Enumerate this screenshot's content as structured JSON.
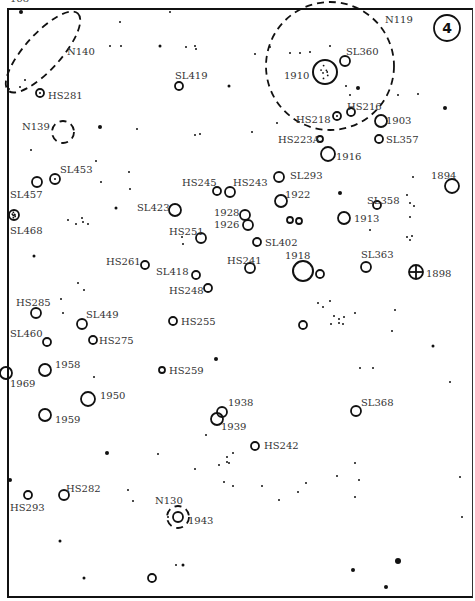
{
  "page": {
    "number": "168",
    "chart_number": "4"
  },
  "nebulae": [
    {
      "id": "N140",
      "type": "ellipse",
      "cx": 43,
      "cy": 52,
      "rx": 52,
      "ry": 18,
      "rot": -48,
      "label_x": 67,
      "label_y": 55
    },
    {
      "id": "N139",
      "type": "circle",
      "cx": 63,
      "cy": 132,
      "r": 11,
      "label_x": 22,
      "label_y": 130
    },
    {
      "id": "N119",
      "type": "circle",
      "cx": 330,
      "cy": 66,
      "r": 64,
      "label_x": 385,
      "label_y": 23
    },
    {
      "id": "N130",
      "type": "circle",
      "cx": 178,
      "cy": 517,
      "r": 11,
      "label_x": 155,
      "label_y": 504
    }
  ],
  "clusters": [
    {
      "id": "HS281",
      "x": 40,
      "y": 93,
      "r": 4,
      "label_x": 48,
      "label_y": 99,
      "double": true
    },
    {
      "id": "SL419",
      "x": 179,
      "y": 86,
      "r": 4,
      "label_x": 175,
      "label_y": 79
    },
    {
      "id": "SL360",
      "x": 345,
      "y": 61,
      "r": 5,
      "label_x": 346,
      "label_y": 55
    },
    {
      "id": "1910",
      "x": 325,
      "y": 72,
      "r": 12,
      "label_x": 284,
      "label_y": 79,
      "dotted": true
    },
    {
      "id": "HS218",
      "x": 337,
      "y": 116,
      "r": 4,
      "label_x": 296,
      "label_y": 123,
      "double": true
    },
    {
      "id": "HS216",
      "x": 351,
      "y": 112,
      "r": 4,
      "label_x": 347,
      "label_y": 110
    },
    {
      "id": "1903",
      "x": 381,
      "y": 121,
      "r": 6,
      "label_x": 386,
      "label_y": 124
    },
    {
      "id": "HS223A",
      "x": 320,
      "y": 139,
      "r": 3,
      "label_x": 278,
      "label_y": 143
    },
    {
      "id": "SL357",
      "x": 379,
      "y": 139,
      "r": 4,
      "label_x": 386,
      "label_y": 143
    },
    {
      "id": "1916",
      "x": 328,
      "y": 154,
      "r": 7,
      "label_x": 336,
      "label_y": 160
    },
    {
      "id": "SL453",
      "x": 55,
      "y": 179,
      "r": 5,
      "label_x": 60,
      "label_y": 173,
      "double": true
    },
    {
      "id": "SL457",
      "x": 37,
      "y": 182,
      "r": 5,
      "label_x": 10,
      "label_y": 198
    },
    {
      "id": "HS245",
      "x": 217,
      "y": 191,
      "r": 4,
      "label_x": 182,
      "label_y": 186
    },
    {
      "id": "HS243",
      "x": 230,
      "y": 192,
      "r": 5,
      "label_x": 233,
      "label_y": 186
    },
    {
      "id": "SL293",
      "x": 279,
      "y": 177,
      "r": 5,
      "label_x": 290,
      "label_y": 179
    },
    {
      "id": "1922",
      "x": 281,
      "y": 201,
      "r": 6,
      "label_x": 285,
      "label_y": 198
    },
    {
      "id": "1894",
      "x": 452,
      "y": 186,
      "r": 7,
      "label_x": 431,
      "label_y": 179
    },
    {
      "id": "SL358",
      "x": 377,
      "y": 205,
      "r": 4,
      "label_x": 367,
      "label_y": 204
    },
    {
      "id": "SL468",
      "x": 14,
      "y": 215,
      "r": 5,
      "label_x": 10,
      "label_y": 234,
      "dotted": true
    },
    {
      "id": "SL423",
      "x": 175,
      "y": 210,
      "r": 6,
      "label_x": 137,
      "label_y": 211
    },
    {
      "id": "1928",
      "x": 245,
      "y": 215,
      "r": 5,
      "label_x": 214,
      "label_y": 216
    },
    {
      "id": "1926",
      "x": 248,
      "y": 225,
      "r": 5,
      "label_x": 214,
      "label_y": 228
    },
    {
      "id": "1913",
      "x": 344,
      "y": 218,
      "r": 6,
      "label_x": 354,
      "label_y": 222
    },
    {
      "id": "HS251",
      "x": 201,
      "y": 238,
      "r": 5,
      "label_x": 169,
      "label_y": 235
    },
    {
      "id": "SL402",
      "x": 257,
      "y": 242,
      "r": 4,
      "label_x": 265,
      "label_y": 246
    },
    {
      "id": "HS261",
      "x": 145,
      "y": 265,
      "r": 4,
      "label_x": 106,
      "label_y": 265
    },
    {
      "id": "HS241",
      "x": 250,
      "y": 268,
      "r": 5,
      "label_x": 227,
      "label_y": 264
    },
    {
      "id": "1918",
      "x": 303,
      "y": 271,
      "r": 10,
      "label_x": 285,
      "label_y": 259
    },
    {
      "id": "SL363",
      "x": 366,
      "y": 267,
      "r": 5,
      "label_x": 361,
      "label_y": 258
    },
    {
      "id": "1898",
      "x": 416,
      "y": 272,
      "r": 7,
      "label_x": 426,
      "label_y": 277,
      "cross": true
    },
    {
      "id": "SL418",
      "x": 196,
      "y": 275,
      "r": 4,
      "label_x": 156,
      "label_y": 275
    },
    {
      "id": "HS248",
      "x": 208,
      "y": 288,
      "r": 4,
      "label_x": 169,
      "label_y": 294
    },
    {
      "id": "HS285",
      "x": 36,
      "y": 313,
      "r": 5,
      "label_x": 16,
      "label_y": 306
    },
    {
      "id": "SL449",
      "x": 82,
      "y": 324,
      "r": 5,
      "label_x": 86,
      "label_y": 318
    },
    {
      "id": "HS255",
      "x": 173,
      "y": 321,
      "r": 4,
      "label_x": 181,
      "label_y": 325
    },
    {
      "id": "SL460",
      "x": 47,
      "y": 342,
      "r": 4,
      "label_x": 10,
      "label_y": 337
    },
    {
      "id": "HS275",
      "x": 93,
      "y": 340,
      "r": 4,
      "label_x": 99,
      "label_y": 344
    },
    {
      "id": "1958",
      "x": 45,
      "y": 370,
      "r": 6,
      "label_x": 55,
      "label_y": 368
    },
    {
      "id": "HS259",
      "x": 162,
      "y": 370,
      "r": 3,
      "label_x": 169,
      "label_y": 374
    },
    {
      "id": "1969",
      "x": 6,
      "y": 373,
      "r": 6,
      "label_x": 10,
      "label_y": 387
    },
    {
      "id": "1950",
      "x": 88,
      "y": 399,
      "r": 7,
      "label_x": 100,
      "label_y": 399
    },
    {
      "id": "1938",
      "x": 222,
      "y": 412,
      "r": 5,
      "label_x": 228,
      "label_y": 406
    },
    {
      "id": "1939",
      "x": 217,
      "y": 419,
      "r": 6,
      "label_x": 221,
      "label_y": 430
    },
    {
      "id": "SL368",
      "x": 356,
      "y": 411,
      "r": 5,
      "label_x": 361,
      "label_y": 406
    },
    {
      "id": "1959",
      "x": 45,
      "y": 415,
      "r": 6,
      "label_x": 55,
      "label_y": 423
    },
    {
      "id": "HS242",
      "x": 255,
      "y": 446,
      "r": 4,
      "label_x": 264,
      "label_y": 449
    },
    {
      "id": "HS282",
      "x": 64,
      "y": 495,
      "r": 5,
      "label_x": 66,
      "label_y": 492
    },
    {
      "id": "HS293",
      "x": 28,
      "y": 495,
      "r": 4,
      "label_x": 10,
      "label_y": 511
    },
    {
      "id": "1943",
      "x": 178,
      "y": 517,
      "r": 5,
      "label_x": 188,
      "label_y": 524
    },
    {
      "id": "",
      "x": 152,
      "y": 578,
      "r": 4
    },
    {
      "id": "",
      "x": 303,
      "y": 325,
      "r": 4
    },
    {
      "id": "",
      "x": 320,
      "y": 274,
      "r": 4
    },
    {
      "id": "",
      "x": 290,
      "y": 220,
      "r": 3
    },
    {
      "id": "",
      "x": 299,
      "y": 221,
      "r": 3
    }
  ],
  "stars": [
    [
      21,
      12,
      2
    ],
    [
      170,
      12,
      1
    ],
    [
      120,
      22,
      1
    ],
    [
      160,
      46,
      1.5
    ],
    [
      121,
      46,
      1
    ],
    [
      110,
      46,
      1
    ],
    [
      186,
      47,
      1
    ],
    [
      195,
      46,
      1
    ],
    [
      229,
      86,
      1.5
    ],
    [
      196,
      49,
      1
    ],
    [
      9,
      89,
      1
    ],
    [
      20,
      87,
      1
    ],
    [
      25,
      80,
      1
    ],
    [
      255,
      54,
      1
    ],
    [
      270,
      47,
      1
    ],
    [
      290,
      53,
      1
    ],
    [
      310,
      52,
      1
    ],
    [
      300,
      53,
      1
    ],
    [
      330,
      46,
      1
    ],
    [
      346,
      86,
      1
    ],
    [
      358,
      88,
      2
    ],
    [
      350,
      95,
      1
    ],
    [
      398,
      95,
      1
    ],
    [
      445,
      108,
      2
    ],
    [
      418,
      94,
      1
    ],
    [
      100,
      127,
      2
    ],
    [
      137,
      129,
      1
    ],
    [
      195,
      135,
      1
    ],
    [
      200,
      134,
      1
    ],
    [
      277,
      123,
      1
    ],
    [
      252,
      132,
      1
    ],
    [
      31,
      150,
      1
    ],
    [
      96,
      161,
      1
    ],
    [
      129,
      172,
      1
    ],
    [
      101,
      182,
      1
    ],
    [
      130,
      189,
      1
    ],
    [
      116,
      208,
      1.5
    ],
    [
      68,
      220,
      1
    ],
    [
      76,
      224,
      1
    ],
    [
      83,
      222,
      1
    ],
    [
      88,
      224,
      1
    ],
    [
      82,
      218,
      1
    ],
    [
      182,
      237,
      1
    ],
    [
      183,
      244,
      1
    ],
    [
      34,
      256,
      1.5
    ],
    [
      413,
      177,
      1
    ],
    [
      407,
      195,
      1
    ],
    [
      410,
      203,
      1
    ],
    [
      414,
      206,
      1
    ],
    [
      410,
      217,
      1
    ],
    [
      370,
      230,
      1
    ],
    [
      407,
      237,
      1
    ],
    [
      410,
      240,
      1
    ],
    [
      412,
      236,
      1
    ],
    [
      340,
      193,
      2
    ],
    [
      78,
      283,
      1
    ],
    [
      84,
      290,
      1
    ],
    [
      94,
      377,
      1
    ],
    [
      216,
      359,
      2
    ],
    [
      318,
      303,
      1
    ],
    [
      323,
      307,
      1
    ],
    [
      330,
      301,
      1
    ],
    [
      339,
      319,
      1
    ],
    [
      344,
      317,
      1
    ],
    [
      339,
      323,
      1
    ],
    [
      343,
      324,
      1
    ],
    [
      355,
      313,
      1
    ],
    [
      331,
      324,
      1
    ],
    [
      334,
      316,
      1
    ],
    [
      395,
      310,
      1
    ],
    [
      392,
      331,
      1
    ],
    [
      433,
      346,
      1.5
    ],
    [
      450,
      382,
      1
    ],
    [
      373,
      368,
      1
    ],
    [
      360,
      368,
      1
    ],
    [
      61,
      299,
      1
    ],
    [
      63,
      313,
      1
    ],
    [
      107,
      453,
      2
    ],
    [
      10,
      480,
      2
    ],
    [
      158,
      454,
      1
    ],
    [
      206,
      435,
      1
    ],
    [
      227,
      457,
      1
    ],
    [
      233,
      453,
      1
    ],
    [
      229,
      463,
      1
    ],
    [
      219,
      465,
      1
    ],
    [
      227,
      462,
      1
    ],
    [
      195,
      469,
      1
    ],
    [
      128,
      490,
      1
    ],
    [
      133,
      501,
      1
    ],
    [
      224,
      482,
      1
    ],
    [
      233,
      486,
      1
    ],
    [
      262,
      486,
      1
    ],
    [
      337,
      476,
      1
    ],
    [
      355,
      463,
      1
    ],
    [
      355,
      497,
      1
    ],
    [
      359,
      480,
      1
    ],
    [
      306,
      483,
      1
    ],
    [
      298,
      492,
      1
    ],
    [
      279,
      500,
      1
    ],
    [
      460,
      477,
      1
    ],
    [
      462,
      517,
      1
    ],
    [
      60,
      541,
      1.5
    ],
    [
      168,
      517,
      1
    ],
    [
      183,
      565,
      1.5
    ],
    [
      176,
      565,
      1
    ],
    [
      84,
      578,
      1.5
    ],
    [
      353,
      570,
      2
    ],
    [
      398,
      561,
      3
    ],
    [
      386,
      587,
      2
    ]
  ]
}
